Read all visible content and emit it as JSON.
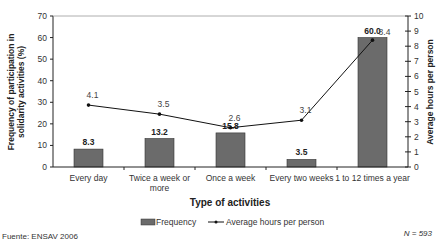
{
  "chart_data": {
    "type": "bar",
    "title": "",
    "categories": [
      "Every day",
      "Twice a week or more",
      "Once a week",
      "Every two weeks",
      "1 to 12 times a year"
    ],
    "category_lines": [
      [
        "Every day"
      ],
      [
        "Twice a week or",
        "more"
      ],
      [
        "Once a week"
      ],
      [
        "Every two weeks"
      ],
      [
        "1 to 12 times a year"
      ]
    ],
    "series": [
      {
        "name": "Frequency",
        "type": "bar",
        "axis": "left",
        "values": [
          8.3,
          13.2,
          15.8,
          3.5,
          60.0
        ],
        "labels": [
          "8.3",
          "13.2",
          "15.8",
          "3.5",
          "60.0"
        ],
        "color": "#6b6b6b"
      },
      {
        "name": "Average hours per person",
        "type": "line",
        "axis": "right",
        "values": [
          4.1,
          3.5,
          2.6,
          3.1,
          8.4
        ],
        "labels": [
          "4.1",
          "3.5",
          "2.6",
          "3.1",
          "8.4"
        ],
        "color": "#111111"
      }
    ],
    "xlabel": "Type of activities",
    "ylabel": "Frequency of participation in solidarity activities (%)",
    "ylabel_lines": [
      "Frequency of participation in",
      "solidarity activities (%)"
    ],
    "y2label": "Average hours per person",
    "ylim": [
      0,
      70
    ],
    "y2lim": [
      0,
      10
    ],
    "yticks": [
      0,
      10,
      20,
      30,
      40,
      50,
      60,
      70
    ],
    "y2ticks": [
      0,
      1,
      2,
      3,
      4,
      5,
      6,
      7,
      8,
      9,
      10
    ],
    "grid": false,
    "legend_position": "bottom"
  },
  "footer": {
    "source": "Fuente: ENSAV 2006",
    "n": "N = 593"
  }
}
